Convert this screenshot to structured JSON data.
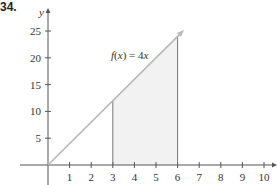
{
  "problem_number": "34.",
  "chart_data": {
    "type": "area",
    "title": "",
    "function_label": "f(x) = 4x",
    "function_label_parts": {
      "f": "f",
      "paren": "(x) = 4",
      "x": "x"
    },
    "xlabel": "",
    "ylabel": "y",
    "x_ticks": [
      1,
      2,
      3,
      4,
      5,
      6,
      7,
      8,
      9,
      10
    ],
    "y_ticks": [
      5,
      10,
      15,
      20,
      25
    ],
    "xlim": [
      0,
      10.5
    ],
    "ylim": [
      0,
      27
    ],
    "line": {
      "slope": 4,
      "intercept": 0,
      "x_start": 0,
      "x_end": 6.2
    },
    "shaded_region": {
      "x_from": 3,
      "x_to": 6,
      "under": "f(x) = 4x"
    },
    "vertical_lines": [
      {
        "x": 3,
        "y": 12
      },
      {
        "x": 6,
        "y": 24
      }
    ],
    "grid": false,
    "colors": {
      "axis": "#555555",
      "line": "#b8b8b8",
      "shade": "#f2f2f2",
      "vertical": "#777777"
    }
  }
}
